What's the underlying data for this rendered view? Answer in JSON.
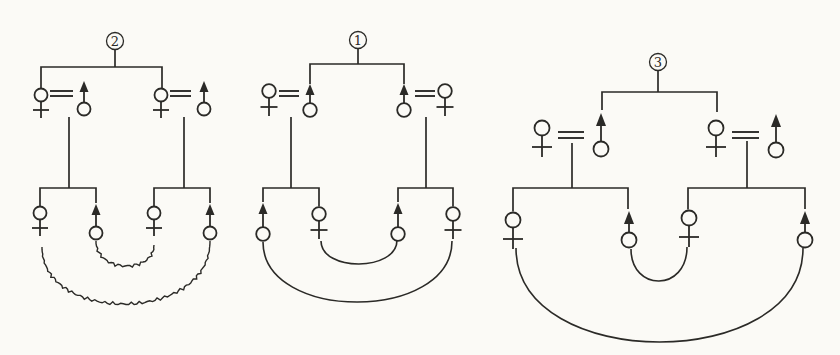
{
  "figure": {
    "type": "kinship-diagrams",
    "diagram_count": 3,
    "paper_color": "#fbfaf6",
    "ink_color": "#2b2a27"
  },
  "diagrams": [
    {
      "label": "2",
      "arc_texture": "wavy",
      "apical": {
        "x": 115,
        "y": 41,
        "r": 8.5
      },
      "symbol_style": {
        "r": 6.5,
        "stem": 23,
        "bar": 15,
        "barHalf": 8,
        "arrowHalf": 4.5,
        "arrowLen": 11,
        "eqHalfGap": 2.5
      },
      "lines": [
        [
          [
            115,
            49.5
          ],
          [
            115,
            67
          ]
        ],
        [
          [
            41,
            88.5
          ],
          [
            41,
            67
          ],
          [
            162,
            67
          ],
          [
            162,
            88.5
          ]
        ],
        [
          [
            69,
            117
          ],
          [
            69,
            188
          ]
        ],
        [
          [
            184,
            117
          ],
          [
            184,
            188
          ]
        ],
        [
          [
            40,
            206.5
          ],
          [
            40,
            188
          ],
          [
            96,
            188
          ],
          [
            96,
            203
          ]
        ],
        [
          [
            154,
            206.5
          ],
          [
            154,
            188
          ],
          [
            210,
            188
          ],
          [
            210,
            203
          ]
        ]
      ],
      "females": [
        [
          41,
          95
        ],
        [
          161,
          95
        ],
        [
          40,
          213
        ],
        [
          154,
          213
        ]
      ],
      "males": [
        [
          84,
          109,
          81
        ],
        [
          204,
          109,
          81
        ],
        [
          96,
          233,
          204
        ],
        [
          210,
          233,
          204
        ]
      ],
      "equals": [
        [
          50,
          73,
          93.5
        ],
        [
          170,
          191,
          93.5
        ]
      ],
      "arcs": [
        [
          96,
          241,
          154,
          245,
          266
        ],
        [
          42,
          247,
          210,
          241,
          304
        ]
      ]
    },
    {
      "label": "1",
      "arc_texture": "smooth",
      "apical": {
        "x": 358,
        "y": 40,
        "r": 8.5
      },
      "symbol_style": {
        "r": 6.8,
        "stem": 25,
        "bar": 16,
        "barHalf": 8.5,
        "arrowHalf": 4.5,
        "arrowLen": 11,
        "eqHalfGap": 2.5
      },
      "lines": [
        [
          [
            358,
            48.5
          ],
          [
            358,
            64
          ]
        ],
        [
          [
            310,
            84
          ],
          [
            310,
            64
          ],
          [
            404,
            64
          ],
          [
            404,
            84
          ]
        ],
        [
          [
            291,
            117
          ],
          [
            291,
            188
          ]
        ],
        [
          [
            426,
            117
          ],
          [
            426,
            188
          ]
        ],
        [
          [
            263,
            202
          ],
          [
            263,
            188
          ],
          [
            319,
            188
          ],
          [
            319,
            206.5
          ]
        ],
        [
          [
            398,
            202
          ],
          [
            398,
            188
          ],
          [
            453,
            188
          ],
          [
            453,
            206.5
          ]
        ]
      ],
      "females": [
        [
          269,
          91
        ],
        [
          445,
          91
        ],
        [
          319,
          214
        ],
        [
          453,
          214
        ]
      ],
      "males": [
        [
          310,
          110,
          84
        ],
        [
          404,
          110,
          84
        ],
        [
          263,
          234,
          203
        ],
        [
          398,
          234,
          203
        ]
      ],
      "equals": [
        [
          279,
          299,
          93.5
        ],
        [
          415,
          435,
          93.5
        ]
      ],
      "arcs": [
        [
          321,
          241,
          397,
          240,
          264
        ],
        [
          263,
          242,
          452,
          241,
          302
        ]
      ]
    },
    {
      "label": "3",
      "arc_texture": "smooth",
      "apical": {
        "x": 658,
        "y": 62,
        "r": 8.5
      },
      "symbol_style": {
        "r": 7.5,
        "stem": 29,
        "bar": 19,
        "barHalf": 10,
        "arrowHalf": 5,
        "arrowLen": 13,
        "eqHalfGap": 3
      },
      "lines": [
        [
          [
            658,
            70.5
          ],
          [
            658,
            92
          ]
        ],
        [
          [
            602,
            110
          ],
          [
            602,
            92
          ],
          [
            717,
            92
          ],
          [
            717,
            112
          ]
        ],
        [
          [
            572,
            143
          ],
          [
            572,
            188
          ]
        ],
        [
          [
            747,
            141
          ],
          [
            747,
            188
          ]
        ],
        [
          [
            513,
            211.5
          ],
          [
            513,
            188
          ],
          [
            628,
            188
          ],
          [
            628,
            209
          ]
        ],
        [
          [
            688,
            209.5
          ],
          [
            688,
            188
          ],
          [
            805,
            188
          ],
          [
            805,
            209
          ]
        ]
      ],
      "females": [
        [
          542,
          128
        ],
        [
          716,
          128
        ],
        [
          513,
          220
        ],
        [
          689,
          218
        ]
      ],
      "males": [
        [
          601,
          149,
          113
        ],
        [
          776,
          150,
          114
        ],
        [
          629,
          240,
          211
        ],
        [
          805,
          240,
          211
        ]
      ],
      "equals": [
        [
          558,
          584,
          135
        ],
        [
          732,
          759,
          135
        ]
      ],
      "arcs": [
        [
          631,
          249,
          687,
          247,
          281
        ],
        [
          516,
          248,
          803,
          248,
          342
        ]
      ]
    }
  ]
}
